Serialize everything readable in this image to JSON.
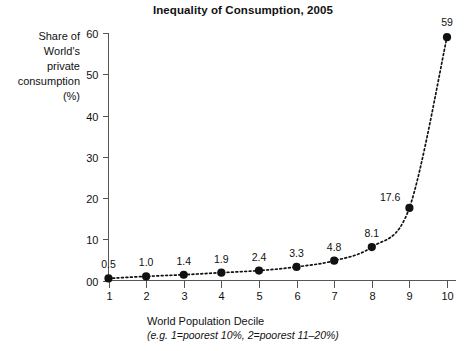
{
  "chart_data": {
    "type": "line",
    "title": "Inequality of Consumption, 2005",
    "xlabel": "World Population Decile",
    "xlabel_note": "(e.g. 1=poorest 10%, 2=poorest 11–20%)",
    "ylabel_lines": [
      "Share of",
      "World's",
      "private",
      "consumption",
      "(%)"
    ],
    "categories": [
      "1",
      "2",
      "3",
      "4",
      "5",
      "6",
      "7",
      "8",
      "9",
      "10"
    ],
    "values": [
      0.5,
      1.0,
      1.4,
      1.9,
      2.4,
      3.3,
      4.8,
      8.1,
      17.6,
      59
    ],
    "point_labels": [
      "0.5",
      "1.0",
      "1.4",
      "1.9",
      "2.4",
      "3.3",
      "4.8",
      "8.1",
      "17.6",
      "59"
    ],
    "xlim": [
      1,
      10
    ],
    "ylim": [
      0,
      60
    ],
    "yticks": [
      0,
      10,
      20,
      30,
      40,
      50,
      60
    ],
    "ytick_labels": [
      "00",
      "10",
      "20",
      "30",
      "40",
      "50",
      "60"
    ],
    "xticks": [
      1,
      2,
      3,
      4,
      5,
      6,
      7,
      8,
      9,
      10
    ],
    "xtick_labels": [
      "1",
      "2",
      "3",
      "4",
      "5",
      "6",
      "7",
      "8",
      "9",
      "10"
    ],
    "grid": false,
    "legend": false,
    "marker": "circle",
    "line_style": "dotted",
    "series_color": "#111111",
    "axis_color": "#555555",
    "background": "#ffffff"
  }
}
